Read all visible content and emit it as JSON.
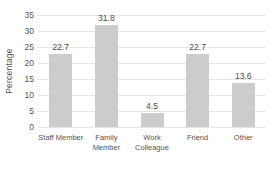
{
  "chart_data": {
    "type": "bar",
    "title": "",
    "categories": [
      "Staff Member",
      "Family Member",
      "Work Colleague",
      "Friend",
      "Other"
    ],
    "values": [
      22.7,
      31.8,
      4.5,
      22.7,
      13.6
    ],
    "data_labels": [
      "22.7",
      "31.8",
      "4.5",
      "22.7",
      "13.6"
    ],
    "xlabel": "",
    "ylabel": "Percentage",
    "ylim": [
      0,
      35
    ],
    "yticks": [
      0,
      5,
      10,
      15,
      20,
      25,
      30,
      35
    ],
    "grid": "horizontal",
    "legend": "none",
    "colors": {
      "bar": "#cbcccc",
      "gridline": "#e5e5e5",
      "text": "#545454",
      "background": "#ffffff"
    }
  }
}
